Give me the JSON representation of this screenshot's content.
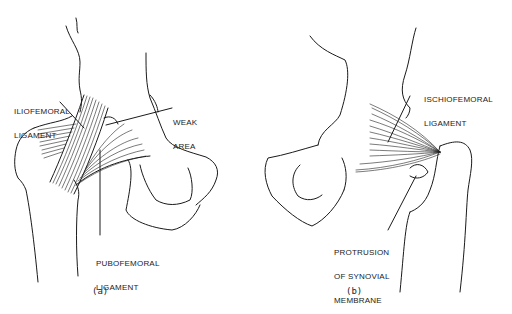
{
  "figure": {
    "panel_a": {
      "caption": "(a)",
      "labels": {
        "iliofemoral_1": "ILIOFEMORAL",
        "iliofemoral_2": "LIGAMENT",
        "weak_1": "WEAK",
        "weak_2": "AREA",
        "pubofemoral_1": "PUBOFEMORAL",
        "pubofemoral_2": "LIGAMENT"
      }
    },
    "panel_b": {
      "caption": "(b)",
      "labels": {
        "ischiofemoral_1": "ISCHIOFEMORAL",
        "ischiofemoral_2": "LIGAMENT",
        "protrusion_1": "PROTRUSION",
        "protrusion_2": "OF SYNOVIAL",
        "protrusion_3": "MEMBRANE"
      }
    }
  }
}
